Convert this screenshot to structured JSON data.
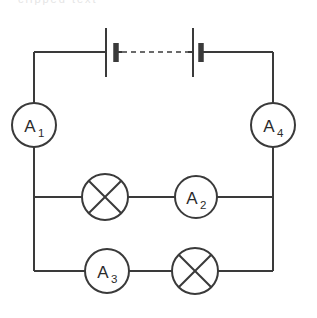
{
  "page": {
    "background_color": "#ffffff",
    "stroke_color": "#3a3a3a",
    "width": 317,
    "height": 318
  },
  "top_text_fragment": {
    "text": "clipped text",
    "note": "faint partially cropped text at very top edge"
  },
  "circuit": {
    "description": "Battery of two cells driving two parallel branches, each containing a lamp and an ammeter, with ammeters A1 and A4 in the main line.",
    "battery": {
      "name": "battery",
      "cells": [
        {
          "name": "cell-left",
          "label": ""
        },
        {
          "name": "cell-right",
          "label": ""
        }
      ],
      "link_style": "dashed"
    },
    "ammeters": [
      {
        "id": "A1",
        "letter": "A",
        "subscript": "1",
        "position": "left main line"
      },
      {
        "id": "A2",
        "letter": "A",
        "subscript": "2",
        "position": "upper parallel branch, right"
      },
      {
        "id": "A3",
        "letter": "A",
        "subscript": "3",
        "position": "lower parallel branch, left"
      },
      {
        "id": "A4",
        "letter": "A",
        "subscript": "4",
        "position": "right main line"
      }
    ],
    "lamps": [
      {
        "id": "L1",
        "symbol": "cross-in-circle",
        "position": "upper parallel branch, left"
      },
      {
        "id": "L2",
        "symbol": "cross-in-circle",
        "position": "lower parallel branch, right"
      }
    ]
  }
}
